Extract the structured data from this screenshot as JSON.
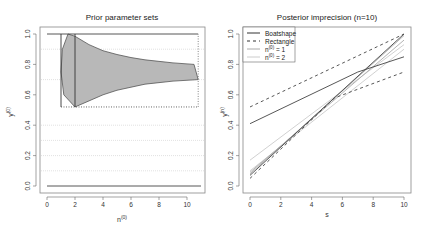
{
  "chart_data": [
    {
      "type": "area",
      "title": "Prior parameter sets",
      "xlabel": "n^(0)",
      "ylabel": "y^(0)",
      "xlim": [
        0,
        11
      ],
      "ylim": [
        0,
        1
      ],
      "xticks": [
        0,
        2,
        4,
        6,
        8,
        10
      ],
      "yticks": [
        0.0,
        0.2,
        0.4,
        0.6,
        0.8,
        1.0
      ],
      "ytick_labels": [
        "0.0",
        "0.2",
        "0.4",
        "0.6",
        "0.8",
        "1.0"
      ],
      "grid": {
        "horizontal_dotted_at": [
          0.1,
          0.2,
          0.3,
          0.4,
          0.7,
          0.9
        ]
      },
      "boatshape": {
        "upper": [
          [
            1.5,
            1.0
          ],
          [
            2.0,
            0.985
          ],
          [
            3.0,
            0.93
          ],
          [
            4.0,
            0.89
          ],
          [
            5.0,
            0.865
          ],
          [
            6.0,
            0.845
          ],
          [
            7.0,
            0.83
          ],
          [
            8.0,
            0.82
          ],
          [
            9.0,
            0.81
          ],
          [
            10.5,
            0.8
          ]
        ],
        "right_edge": [
          [
            10.5,
            0.8
          ],
          [
            10.8,
            0.7
          ]
        ],
        "lower": [
          [
            10.8,
            0.7
          ],
          [
            9.0,
            0.69
          ],
          [
            8.0,
            0.68
          ],
          [
            7.0,
            0.67
          ],
          [
            6.0,
            0.65
          ],
          [
            5.0,
            0.63
          ],
          [
            4.0,
            0.6
          ],
          [
            3.0,
            0.56
          ],
          [
            2.0,
            0.52
          ]
        ],
        "left_edge": [
          [
            2.0,
            0.52
          ],
          [
            1.2,
            0.6
          ],
          [
            1.0,
            0.75
          ],
          [
            1.1,
            0.9
          ],
          [
            1.5,
            1.0
          ]
        ]
      },
      "rectangle": {
        "n_range": [
          1.0,
          10.8
        ],
        "y_range": [
          0.52,
          1.0
        ]
      },
      "vertical_lines": [
        {
          "n": 1.0,
          "y_range": [
            0.52,
            1.0
          ]
        },
        {
          "n": 2.0,
          "y_range": [
            0.52,
            1.0
          ]
        }
      ],
      "hlines": [
        {
          "y": 1.0,
          "x_range": [
            0,
            10.8
          ],
          "style": "solid"
        },
        {
          "y": 0.0,
          "x_range": [
            0,
            11
          ],
          "style": "solid"
        },
        {
          "y": 0.52,
          "x_range": [
            1.0,
            10.8
          ],
          "style": "dotted"
        }
      ]
    },
    {
      "type": "line",
      "title": "Posterior imprecision (n=10)",
      "xlabel": "s",
      "ylabel": "y^(n)",
      "xlim": [
        0,
        10
      ],
      "ylim": [
        0,
        1
      ],
      "xticks": [
        0,
        2,
        4,
        6,
        8,
        10
      ],
      "yticks": [
        0.0,
        0.2,
        0.4,
        0.6,
        0.8,
        1.0
      ],
      "ytick_labels": [
        "0.0",
        "0.2",
        "0.4",
        "0.6",
        "0.8",
        "1.0"
      ],
      "legend": {
        "position": "topleft",
        "entries": [
          {
            "label": "Boatshape",
            "style": "solid",
            "color": "#333333"
          },
          {
            "label": "Rectangle",
            "style": "dashed",
            "color": "#333333"
          },
          {
            "label": "n^(0) = 1",
            "style": "solid",
            "color": "#aaaaaa"
          },
          {
            "label": "n^(0) = 2",
            "style": "solid",
            "color": "#cccccc"
          }
        ]
      },
      "series": [
        {
          "name": "Boatshape upper",
          "style": "solid",
          "color": "#444444",
          "points": [
            [
              0,
              0.41
            ],
            [
              7,
              0.75
            ],
            [
              10,
              0.85
            ]
          ]
        },
        {
          "name": "Boatshape lower",
          "style": "solid",
          "color": "#444444",
          "points": [
            [
              0,
              0.07
            ],
            [
              7.3,
              0.75
            ],
            [
              10,
              1.0
            ]
          ]
        },
        {
          "name": "Rectangle upper",
          "style": "dashed",
          "color": "#444444",
          "points": [
            [
              0,
              0.52
            ],
            [
              10,
              1.0
            ]
          ]
        },
        {
          "name": "Rectangle lower",
          "style": "dashed",
          "color": "#444444",
          "points": [
            [
              0,
              0.05
            ],
            [
              5.5,
              0.58
            ],
            [
              10,
              0.75
            ]
          ]
        },
        {
          "name": "n^(0) = 1 upper",
          "style": "solid",
          "color": "#aaaaaa",
          "points": [
            [
              0,
              0.09
            ],
            [
              10,
              0.96
            ]
          ]
        },
        {
          "name": "n^(0) = 1 lower",
          "style": "solid",
          "color": "#aaaaaa",
          "points": [
            [
              0,
              0.08
            ],
            [
              10,
              0.99
            ]
          ]
        },
        {
          "name": "n^(0) = 2 upper",
          "style": "solid",
          "color": "#cccccc",
          "points": [
            [
              0,
              0.17
            ],
            [
              10,
              0.93
            ]
          ]
        },
        {
          "name": "n^(0) = 2 lower",
          "style": "solid",
          "color": "#cccccc",
          "points": [
            [
              0,
              0.1
            ],
            [
              10,
              0.9
            ]
          ]
        }
      ]
    }
  ],
  "labels": {
    "left_title": "Prior parameter sets",
    "right_title": "Posterior imprecision (n=10)",
    "left_xlabel_base": "n",
    "left_xlabel_sup": "(0)",
    "left_ylabel_base": "y",
    "left_ylabel_sup": "(0)",
    "right_xlabel": "s",
    "right_ylabel_base": "y",
    "right_ylabel_sup": "(n)",
    "legend_boatshape": "Boatshape",
    "legend_rectangle": "Rectangle",
    "legend_n1_base": "n",
    "legend_n1_sup": "(0)",
    "legend_n1_tail": " = 1",
    "legend_n2_base": "n",
    "legend_n2_sup": "(0)",
    "legend_n2_tail": " = 2"
  }
}
